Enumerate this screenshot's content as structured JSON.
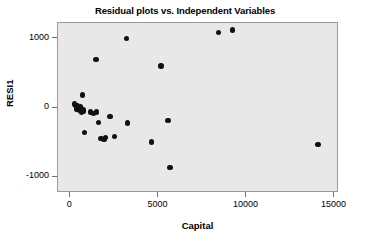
{
  "chart_data": {
    "type": "scatter",
    "title": "Residual plots vs. Independent Variables",
    "xlabel": "Capital",
    "ylabel": "RESI1",
    "xlim": [
      -700,
      15250
    ],
    "ylim": [
      -1230,
      1230
    ],
    "xticks": [
      0,
      5000,
      10000,
      15000
    ],
    "xticklabels": [
      "0",
      "5000",
      "10000",
      "15000"
    ],
    "yticks": [
      1000,
      0,
      -1000
    ],
    "yticklabels": [
      "1000",
      "0",
      "-1000"
    ],
    "grid": false,
    "legend": null,
    "panel_color": "#e8e8e8",
    "marker_color": "#111111",
    "series": [
      {
        "name": "RESI1",
        "points": [
          [
            220,
            60
          ],
          [
            300,
            40
          ],
          [
            340,
            10
          ],
          [
            380,
            -20
          ],
          [
            420,
            30
          ],
          [
            470,
            0
          ],
          [
            520,
            -30
          ],
          [
            560,
            20
          ],
          [
            600,
            -10
          ],
          [
            650,
            -60
          ],
          [
            700,
            190
          ],
          [
            720,
            -50
          ],
          [
            760,
            -30
          ],
          [
            800,
            -350
          ],
          [
            1150,
            -60
          ],
          [
            1300,
            -80
          ],
          [
            1450,
            700
          ],
          [
            1500,
            -60
          ],
          [
            1600,
            -210
          ],
          [
            1750,
            -440
          ],
          [
            1900,
            -460
          ],
          [
            2000,
            -430
          ],
          [
            2250,
            -120
          ],
          [
            2500,
            -410
          ],
          [
            3200,
            1010
          ],
          [
            3250,
            -215
          ],
          [
            4600,
            -490
          ],
          [
            5150,
            610
          ],
          [
            5550,
            -180
          ],
          [
            5650,
            -860
          ],
          [
            8400,
            1090
          ],
          [
            9200,
            1130
          ],
          [
            14050,
            -530
          ]
        ]
      }
    ]
  }
}
